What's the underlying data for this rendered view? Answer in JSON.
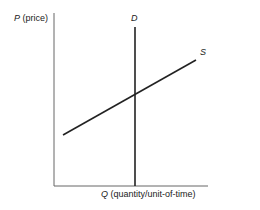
{
  "diagram": {
    "type": "supply-demand",
    "y_axis": {
      "symbol": "P",
      "label": "(price)"
    },
    "x_axis": {
      "symbol": "Q",
      "label": "(quantity/unit-of-time)"
    },
    "curves": [
      {
        "name": "D",
        "kind": "vertical demand line"
      },
      {
        "name": "S",
        "kind": "upward sloping supply line"
      }
    ],
    "colors": {
      "line": "#222222",
      "axis": "#555555",
      "background": "#ffffff"
    }
  }
}
